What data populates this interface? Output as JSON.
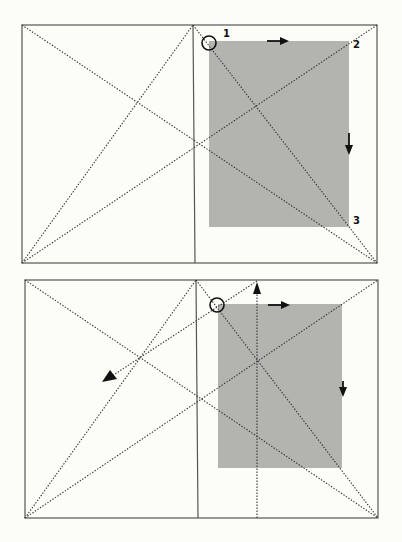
{
  "background": "#fdfdf7",
  "colors": {
    "frame": "#555555",
    "text_block": "#b3b3af",
    "ink": "#111111"
  },
  "diagrams": [
    {
      "name": "top-spread",
      "frame": {
        "x1": 22,
        "y1": 25,
        "x2": 377,
        "y2": 263
      },
      "spine": {
        "top": [
          193,
          25
        ],
        "bottom": [
          195,
          263
        ]
      },
      "text_block": {
        "x": 209,
        "y": 41,
        "w": 140,
        "h": 186
      },
      "circle": {
        "cx": 209,
        "cy": 43,
        "r": 7
      },
      "labels": [
        {
          "text": "1",
          "x": 223,
          "y": 37
        },
        {
          "text": "2",
          "x": 353,
          "y": 48
        },
        {
          "text": "3",
          "x": 353,
          "y": 224
        }
      ],
      "arrows": [
        {
          "dir": "right",
          "x": 267,
          "y": 41,
          "len": 20
        },
        {
          "dir": "down",
          "x": 349,
          "y": 133,
          "len": 20
        }
      ]
    },
    {
      "name": "bottom-spread",
      "frame": {
        "x1": 25,
        "y1": 280,
        "x2": 378,
        "y2": 518
      },
      "spine": {
        "top": [
          196,
          280
        ],
        "bottom": [
          198,
          518
        ]
      },
      "text_block": {
        "x": 218,
        "y": 304,
        "w": 124,
        "h": 164
      },
      "circle": {
        "cx": 217,
        "cy": 305,
        "r": 7
      },
      "labels": [],
      "arrows": [
        {
          "dir": "right",
          "x": 268,
          "y": 305,
          "len": 20
        },
        {
          "dir": "down",
          "x": 343,
          "y": 381,
          "len": 16
        }
      ],
      "construction_arrows": [
        {
          "from": [
            257,
            518
          ],
          "to": [
            257,
            282
          ]
        },
        {
          "from": [
            257,
            281
          ],
          "to": [
            102,
            382
          ]
        }
      ]
    }
  ]
}
